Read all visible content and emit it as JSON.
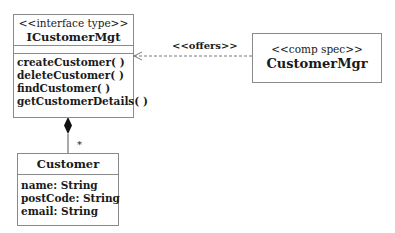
{
  "interface": {
    "stereotype": "<<interface type>>",
    "name": "ICustomerMgt",
    "operations": [
      "createCustomer( )",
      "deleteCustomer( )",
      "findCustomer( )",
      "getCustomerDetails( )"
    ]
  },
  "component": {
    "stereotype": "<<comp spec>>",
    "name": "CustomerMgr"
  },
  "entity": {
    "name": "Customer",
    "attributes": [
      "name: String",
      "postCode: String",
      "email: String"
    ]
  },
  "relations": {
    "offers_label": "<<offers>>",
    "multiplicity": "*"
  }
}
